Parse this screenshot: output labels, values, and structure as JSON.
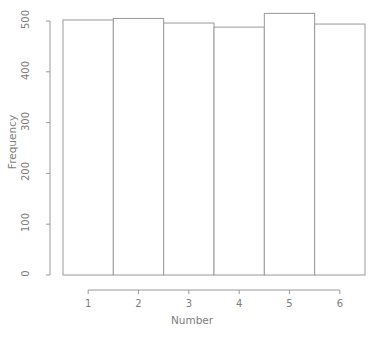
{
  "chart_data": {
    "type": "bar",
    "title": "",
    "xlabel": "Number",
    "ylabel": "Frequency",
    "categories": [
      "1",
      "2",
      "3",
      "4",
      "5",
      "6"
    ],
    "values": [
      502,
      505,
      496,
      488,
      515,
      494
    ],
    "ylim": [
      0,
      530
    ],
    "yticks": [
      0,
      100,
      200,
      300,
      400,
      500
    ],
    "ytick_labels": [
      "0",
      "100",
      "200",
      "300",
      "400",
      "500"
    ],
    "xticks": [
      1,
      2,
      3,
      4,
      5,
      6
    ],
    "xtick_labels": [
      "1",
      "2",
      "3",
      "4",
      "5",
      "6"
    ],
    "grid": false,
    "legend": null,
    "bar_fill": "#ffffff",
    "bar_stroke": "#9a9a9a",
    "axis_color": "#9a9a9a",
    "text_color": "#7d7d7d",
    "background": "#ffffff"
  },
  "axes": {
    "y_title": "Frequency",
    "x_title": "Number",
    "y_labels": [
      "0",
      "100",
      "200",
      "300",
      "400",
      "500"
    ],
    "x_labels": [
      "1",
      "2",
      "3",
      "4",
      "5",
      "6"
    ]
  }
}
